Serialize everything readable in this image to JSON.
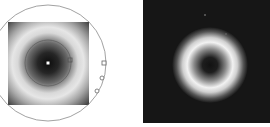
{
  "figure": {
    "panels": [
      {
        "id": "left",
        "description": "Grayscale square intensity image with radial rings overlaid by a large circle and markers",
        "square": {
          "x": 8,
          "y": 22,
          "w": 81,
          "h": 83
        },
        "center": {
          "x": 48,
          "y": 63
        },
        "outer_circle_radius": 58,
        "inner_circle_radius": 23,
        "center_dot_color": "#ffffff",
        "markers": [
          {
            "shape": "square",
            "x": 70,
            "y": 60
          },
          {
            "shape": "square",
            "x": 104,
            "y": 63
          },
          {
            "shape": "circle",
            "x": 102,
            "y": 78
          },
          {
            "shape": "circle",
            "x": 97,
            "y": 91
          }
        ],
        "colors": {
          "line": "#8a8a8a",
          "dark": "#1a1a1a",
          "light": "#e8e8e8"
        }
      },
      {
        "id": "right",
        "description": "Dark square image with a bright donut-shaped ring",
        "square": {
          "x": 143,
          "y": 0,
          "w": 127,
          "h": 123
        },
        "ring_center": {
          "x": 210,
          "y": 65
        },
        "ring_outer_radius": 36,
        "ring_hole_radius": 9,
        "colors": {
          "background": "#161616",
          "ring": "#f0f0f0"
        }
      }
    ]
  }
}
